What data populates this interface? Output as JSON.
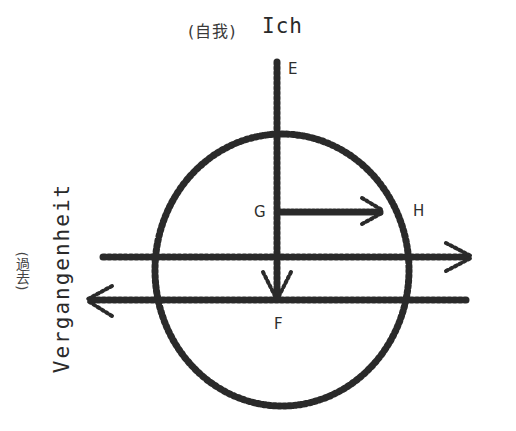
{
  "diagram": {
    "title": {
      "cjk": "(自我)",
      "german": "Ich"
    },
    "side_label": {
      "cjk": "(過去)",
      "german": "Vergangenheit"
    },
    "points": {
      "E": "E",
      "G": "G",
      "H": "H",
      "F": "F"
    },
    "elements": [
      {
        "type": "circle",
        "style": "hatched",
        "center": [
          282,
          270
        ],
        "rx": 127,
        "ry": 136
      },
      {
        "type": "line",
        "name": "vertical-axis-E-F",
        "from": [
          277,
          62
        ],
        "to": [
          277,
          300
        ],
        "arrow": "down",
        "arrow_at": [
          277,
          296
        ]
      },
      {
        "type": "line",
        "name": "arrow-G-H",
        "from": [
          277,
          212
        ],
        "to": [
          382,
          212
        ],
        "arrow": "right"
      },
      {
        "type": "line",
        "name": "upper-horizontal-axis",
        "from": [
          103,
          257
        ],
        "to": [
          470,
          257
        ],
        "arrow": "right"
      },
      {
        "type": "line",
        "name": "lower-horizontal-axis",
        "from": [
          465,
          300
        ],
        "to": [
          88,
          300
        ],
        "arrow": "left"
      }
    ],
    "colors": {
      "ink": "#2a2a2a",
      "background": "#ffffff"
    }
  }
}
